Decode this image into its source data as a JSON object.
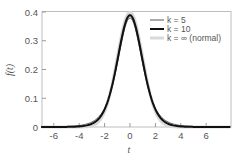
{
  "chart_data": {
    "type": "line",
    "title": "",
    "xlabel": "t",
    "ylabel": "f(t)",
    "xlim": [
      -7,
      8
    ],
    "ylim": [
      0,
      0.4
    ],
    "x_ticks": [
      -6,
      -4,
      -2,
      0,
      2,
      4,
      6
    ],
    "x_tick_labels": [
      "-6",
      "-4",
      "-2",
      "0",
      "2",
      "4",
      "6"
    ],
    "y_ticks": [
      0,
      0.1,
      0.2,
      0.3,
      0.4
    ],
    "y_tick_labels": [
      "0",
      "0.1",
      "0.2",
      "0.3",
      "0.4"
    ],
    "grid": false,
    "legend_position": "upper right",
    "x": [
      -7,
      -6,
      -5,
      -4,
      -3.5,
      -3,
      -2.5,
      -2,
      -1.5,
      -1,
      -0.5,
      0,
      0.5,
      1,
      1.5,
      2,
      2.5,
      3,
      3.5,
      4,
      5,
      6,
      7,
      8
    ],
    "series": [
      {
        "name": "k = 5",
        "color": "#555555",
        "width": 1,
        "values": [
          0.0011,
          0.0018,
          0.0018,
          0.0051,
          0.0092,
          0.0173,
          0.0335,
          0.0651,
          0.1245,
          0.2197,
          0.3279,
          0.3796,
          0.3279,
          0.2197,
          0.1245,
          0.0651,
          0.0335,
          0.0173,
          0.0092,
          0.0051,
          0.0018,
          0.0007,
          0.0003,
          0.0002
        ]
      },
      {
        "name": "k = 10",
        "color": "#111111",
        "width": 2,
        "values": [
          0.0,
          0.0001,
          0.0004,
          0.002,
          0.0048,
          0.0114,
          0.0269,
          0.0611,
          0.1274,
          0.2304,
          0.3397,
          0.3891,
          0.3397,
          0.2304,
          0.1274,
          0.0611,
          0.0269,
          0.0114,
          0.0048,
          0.002,
          0.0004,
          0.0001,
          0.0,
          0.0
        ]
      },
      {
        "name": "k = ∞ (normal)",
        "color": "#d9d9d9",
        "width": 3,
        "values": [
          0.0,
          0.0,
          0.0,
          0.0001,
          0.0009,
          0.0044,
          0.0175,
          0.054,
          0.1295,
          0.242,
          0.3521,
          0.3989,
          0.3521,
          0.242,
          0.1295,
          0.054,
          0.0175,
          0.0044,
          0.0009,
          0.0001,
          0.0,
          0.0,
          0.0,
          0.0
        ]
      }
    ]
  },
  "legend": {
    "items": [
      {
        "label": "k = 5"
      },
      {
        "label": "k = 10"
      },
      {
        "label": "k = ∞ (normal)"
      }
    ]
  },
  "axes": {
    "xlabel": "t",
    "ylabel": "f(t)"
  }
}
